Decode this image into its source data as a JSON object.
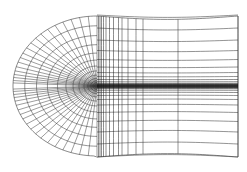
{
  "figure": {
    "type": "grid-diagram",
    "background_color": "#ffffff",
    "line_color": "#3a3a3a",
    "line_color_dense": "#1a1a1a",
    "width": 247,
    "height": 172
  },
  "geometry": {
    "centerline_y": 86,
    "nose_x": 97,
    "nose_y": 86,
    "outer_left_x": 13,
    "outer_top_y": 16,
    "outer_bottom_y": 157,
    "right_edge_x": 238,
    "body_tail_x": 238,
    "fan_center_x": 97,
    "fan_center_y": 86
  },
  "mesh_data": {
    "type": "structured-c-grid",
    "radial_line_count_upper": 20,
    "radial_line_count_lower": 20,
    "circumferential_arc_count": 13,
    "wake_horizontal_line_count_upper": 13,
    "wake_horizontal_line_count_lower": 13,
    "wake_vertical_line_count": 14,
    "radial_angles_deg_upper": [
      90,
      84,
      78,
      72,
      66,
      60,
      54,
      48,
      43,
      38,
      33,
      28,
      24,
      20,
      16,
      12.5,
      9.5,
      7,
      4.5,
      2.5
    ],
    "arc_radial_fractions": [
      1.0,
      0.86,
      0.72,
      0.59,
      0.47,
      0.37,
      0.285,
      0.215,
      0.155,
      0.11,
      0.075,
      0.048,
      0.026
    ],
    "wake_vertical_x": [
      98.5,
      100,
      101.5,
      103.5,
      106,
      109.5,
      113.5,
      118.5,
      122,
      128,
      136,
      143,
      178,
      238
    ],
    "wake_horizontal_offsets": [
      71,
      58,
      46,
      35.5,
      26.5,
      19,
      13.5,
      9.5,
      6.5,
      4.3,
      2.7,
      1.5,
      0.6
    ]
  },
  "labels": {
    "caption": ""
  }
}
